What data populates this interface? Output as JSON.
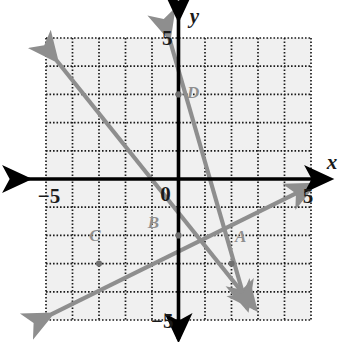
{
  "figure": {
    "title": "",
    "background_color": "#ffffff",
    "grid_fill": "#f0f0f0",
    "grid_line_color": "#1a1a1a",
    "axis_color": "#000000",
    "line_color": "#8e8e8e",
    "label_color": "#8e8e8e"
  },
  "axes": {
    "x_name": "x",
    "y_name": "y",
    "origin_label": "0",
    "x_min_label": "−5",
    "x_max_label": "5",
    "y_min_label": "−5",
    "y_max_label": "5",
    "x_range": [
      -5,
      5
    ],
    "y_range": [
      -5,
      5
    ],
    "grid_step": 1,
    "grid_style": "dotted"
  },
  "chart_data": {
    "type": "line",
    "title": "",
    "xlabel": "x",
    "ylabel": "y",
    "xlim": [
      -5,
      5
    ],
    "ylim": [
      -5,
      5
    ],
    "grid": true,
    "legend": "none",
    "series": [
      {
        "name": "line-steep-D-A",
        "points": [
          [
            -0.35,
            5.0
          ],
          [
            2.6,
            -4.6
          ]
        ],
        "slope": -3.0,
        "intercept": 3.0,
        "arrows": "both",
        "passes_through": [
          "D",
          "A"
        ]
      },
      {
        "name": "line-medium-B-A",
        "points": [
          [
            -4.6,
            4.2
          ],
          [
            2.9,
            -4.6
          ]
        ],
        "slope": -1.17,
        "intercept": -1.2,
        "arrows": "both",
        "passes_through": [
          "B",
          "A"
        ]
      },
      {
        "name": "line-rising-C-B",
        "points": [
          [
            -4.8,
            -4.8
          ],
          [
            5.1,
            -0.2
          ]
        ],
        "slope": 0.5,
        "intercept": -2.0,
        "arrows": "both",
        "passes_through": [
          "C",
          "B"
        ]
      }
    ],
    "points": [
      {
        "label": "A",
        "x": 2,
        "y": -3,
        "marker": true,
        "label_dx": 0.35,
        "label_dy": 0.75
      },
      {
        "label": "B",
        "x": 0,
        "y": -2,
        "marker": true,
        "label_dx": -0.95,
        "label_dy": 0.28
      },
      {
        "label": "C",
        "x": -3,
        "y": -3,
        "marker": true,
        "label_dx": -0.15,
        "label_dy": 0.8
      },
      {
        "label": "D",
        "x": 0,
        "y": 3,
        "marker": true,
        "label_dx": 0.55,
        "label_dy": -0.12
      }
    ],
    "tick_labels": {
      "x": [
        "−5",
        "5"
      ],
      "y": [
        "5",
        "−5"
      ],
      "origin": "0"
    }
  }
}
